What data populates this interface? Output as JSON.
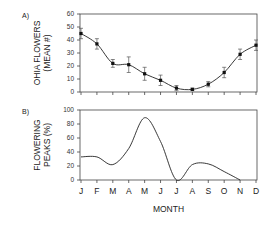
{
  "chart_data": [
    {
      "type": "line",
      "panel_label": "A)",
      "title": "",
      "ylabel_lines": [
        "OHIA FLOWERS",
        "(MEAN #)"
      ],
      "xlabel": "",
      "ylim": [
        0,
        60
      ],
      "yticks": [
        0,
        10,
        20,
        30,
        40,
        50,
        60
      ],
      "categories": [
        "J",
        "F",
        "M",
        "A",
        "M",
        "J",
        "J",
        "A",
        "S",
        "O",
        "N",
        "D"
      ],
      "series": [
        {
          "name": "Ohia flowers (mean #)",
          "values": [
            45,
            37,
            22,
            21,
            14,
            9,
            3,
            2,
            6,
            15,
            29,
            36
          ],
          "error": [
            4,
            4,
            3,
            6,
            5,
            4,
            2,
            1,
            2,
            4,
            4,
            4
          ],
          "markers": true
        }
      ],
      "grid": false
    },
    {
      "type": "line",
      "panel_label": "B)",
      "title": "",
      "ylabel_lines": [
        "FLOWERING",
        "PEAKS (%)"
      ],
      "xlabel": "MONTH",
      "ylim": [
        0,
        100
      ],
      "yticks": [
        0,
        20,
        40,
        60,
        80,
        100
      ],
      "categories": [
        "J",
        "F",
        "M",
        "A",
        "M",
        "J",
        "J",
        "A",
        "S",
        "O",
        "N",
        "D"
      ],
      "series": [
        {
          "name": "Flowering peaks (%)",
          "values": [
            33,
            33,
            22,
            45,
            89,
            55,
            0,
            22,
            23,
            12,
            0,
            null
          ],
          "markers": false
        }
      ],
      "grid": false
    }
  ]
}
